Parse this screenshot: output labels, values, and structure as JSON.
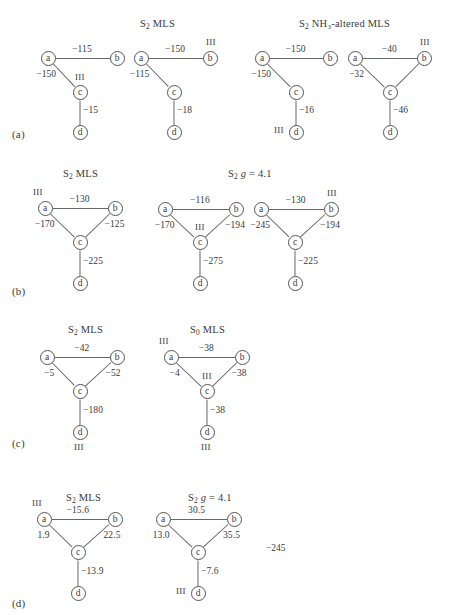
{
  "figure": {
    "caption_labels": [
      "(a)",
      "(b)",
      "(c)",
      "(d)"
    ],
    "node_labels": [
      "a",
      "b",
      "c",
      "d"
    ],
    "oxidation_mark": "III",
    "extra_value": "−245"
  },
  "panels": [
    {
      "label": "(a)",
      "groups": [
        {
          "title_parts": {
            "pre": "S",
            "sub": "2",
            "post": " MLS"
          },
          "diagrams": [
            {
              "edges": [
                {
                  "from": "a",
                  "to": "b",
                  "value": "−115"
                },
                {
                  "from": "a",
                  "to": "c",
                  "value": "−150"
                },
                {
                  "from": "c",
                  "to": "d",
                  "value": "−15"
                }
              ],
              "oxidation_on": [
                "c"
              ]
            },
            {
              "edges": [
                {
                  "from": "a",
                  "to": "b",
                  "value": "−150"
                },
                {
                  "from": "a",
                  "to": "c",
                  "value": "−115"
                },
                {
                  "from": "c",
                  "to": "d",
                  "value": "−18"
                }
              ],
              "oxidation_on": [
                "b"
              ]
            }
          ]
        },
        {
          "title_parts": {
            "pre": "S",
            "sub": "2",
            "post": " NH₃-altered MLS"
          },
          "diagrams": [
            {
              "edges": [
                {
                  "from": "a",
                  "to": "b",
                  "value": "−150"
                },
                {
                  "from": "a",
                  "to": "c",
                  "value": "−150"
                },
                {
                  "from": "c",
                  "to": "d",
                  "value": "−16"
                }
              ],
              "oxidation_on": [
                "d"
              ]
            },
            {
              "edges": [
                {
                  "from": "a",
                  "to": "b",
                  "value": "−40"
                },
                {
                  "from": "a",
                  "to": "c",
                  "value": "−32"
                },
                {
                  "from": "b",
                  "to": "c",
                  "value": ""
                },
                {
                  "from": "c",
                  "to": "d",
                  "value": "−46"
                }
              ],
              "oxidation_on": [
                "b"
              ]
            }
          ]
        }
      ]
    },
    {
      "label": "(b)",
      "groups": [
        {
          "title_parts": {
            "pre": "S",
            "sub": "2",
            "post": " MLS"
          },
          "diagrams": [
            {
              "edges": [
                {
                  "from": "a",
                  "to": "b",
                  "value": "−130"
                },
                {
                  "from": "a",
                  "to": "c",
                  "value": "−170"
                },
                {
                  "from": "b",
                  "to": "c",
                  "value": "−125"
                },
                {
                  "from": "c",
                  "to": "d",
                  "value": "−225"
                }
              ],
              "oxidation_on": [
                "a"
              ]
            }
          ]
        },
        {
          "title_parts": {
            "pre": "S",
            "sub": "2",
            "post": " g = 4.1",
            "italic_g": true
          },
          "diagrams": [
            {
              "edges": [
                {
                  "from": "a",
                  "to": "b",
                  "value": "−116"
                },
                {
                  "from": "a",
                  "to": "c",
                  "value": "−170"
                },
                {
                  "from": "b",
                  "to": "c",
                  "value": "−194"
                },
                {
                  "from": "c",
                  "to": "d",
                  "value": "−275"
                }
              ],
              "oxidation_on": [
                "c"
              ]
            },
            {
              "edges": [
                {
                  "from": "a",
                  "to": "b",
                  "value": "−130"
                },
                {
                  "from": "a",
                  "to": "c",
                  "value": "−245"
                },
                {
                  "from": "b",
                  "to": "c",
                  "value": "−194"
                },
                {
                  "from": "c",
                  "to": "d",
                  "value": "−225"
                }
              ],
              "oxidation_on": [
                "b"
              ]
            }
          ]
        }
      ]
    },
    {
      "label": "(c)",
      "groups": [
        {
          "title_parts": {
            "pre": "S",
            "sub": "2",
            "post": " MLS"
          },
          "diagrams": [
            {
              "edges": [
                {
                  "from": "a",
                  "to": "b",
                  "value": "−42"
                },
                {
                  "from": "a",
                  "to": "c",
                  "value": "−5"
                },
                {
                  "from": "b",
                  "to": "c",
                  "value": "−52"
                },
                {
                  "from": "c",
                  "to": "d",
                  "value": "−180"
                }
              ],
              "oxidation_on": [
                "d-below"
              ]
            }
          ]
        },
        {
          "title_parts": {
            "pre": "S",
            "sub": "0",
            "post": " MLS"
          },
          "diagrams": [
            {
              "edges": [
                {
                  "from": "a",
                  "to": "b",
                  "value": "−38"
                },
                {
                  "from": "a",
                  "to": "c",
                  "value": "−4"
                },
                {
                  "from": "b",
                  "to": "c",
                  "value": "−38"
                },
                {
                  "from": "c",
                  "to": "d",
                  "value": "−38"
                }
              ],
              "oxidation_on": [
                "a",
                "c",
                "d-below"
              ]
            }
          ]
        }
      ]
    },
    {
      "label": "(d)",
      "groups": [
        {
          "title_parts": {
            "pre": "S",
            "sub": "2",
            "post": " MLS"
          },
          "diagrams": [
            {
              "edges": [
                {
                  "from": "a",
                  "to": "b",
                  "value": "−15.6"
                },
                {
                  "from": "a",
                  "to": "c",
                  "value": "1.9"
                },
                {
                  "from": "b",
                  "to": "c",
                  "value": "22.5"
                },
                {
                  "from": "c",
                  "to": "d",
                  "value": "−13.9"
                }
              ],
              "oxidation_on": [
                "a"
              ]
            }
          ]
        },
        {
          "title_parts": {
            "pre": "S",
            "sub": "2",
            "post": " g = 4.1",
            "italic_g": true
          },
          "diagrams": [
            {
              "edges": [
                {
                  "from": "a",
                  "to": "b",
                  "value": "30.5"
                },
                {
                  "from": "a",
                  "to": "c",
                  "value": "13.0"
                },
                {
                  "from": "b",
                  "to": "c",
                  "value": "35.5"
                },
                {
                  "from": "c",
                  "to": "d",
                  "value": "−7.6"
                }
              ],
              "oxidation_on": [
                "d"
              ],
              "extra": "−245"
            }
          ]
        }
      ]
    }
  ]
}
